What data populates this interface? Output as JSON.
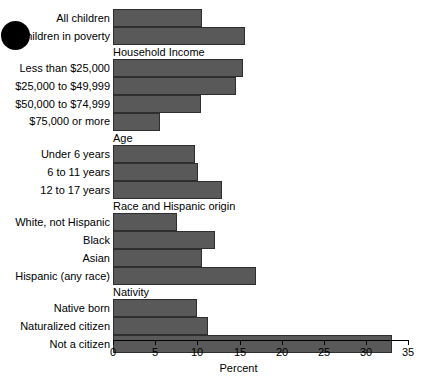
{
  "chart_data": {
    "type": "bar",
    "orientation": "horizontal",
    "title": "",
    "xlabel": "Percent",
    "ylabel": "",
    "xlim": [
      0,
      35
    ],
    "xticks": [
      0,
      5,
      10,
      15,
      20,
      25,
      30,
      35
    ],
    "grid": false,
    "legend": null,
    "bar_color": "#595959",
    "bar_edge_color": "#2e2e2e",
    "groups": [
      {
        "header": "",
        "categories": [
          "All children",
          "Children in poverty"
        ],
        "values": [
          10.6,
          15.7
        ]
      },
      {
        "header": "Household Income",
        "categories": [
          "Less than $25,000",
          "$25,000 to $49,999",
          "$50,000 to $74,999",
          "$75,000 or more"
        ],
        "values": [
          15.4,
          14.6,
          10.4,
          5.6
        ]
      },
      {
        "header": "Age",
        "categories": [
          "Under 6 years",
          "6 to 11 years",
          "12 to 17 years"
        ],
        "values": [
          9.7,
          10.1,
          12.9
        ]
      },
      {
        "header": "Race and Hispanic origin",
        "categories": [
          "White, not Hispanic",
          "Black",
          "Asian",
          "Hispanic (any race)"
        ],
        "values": [
          7.6,
          12.1,
          10.6,
          17.0
        ]
      },
      {
        "header": "Nativity",
        "categories": [
          "Native born",
          "Naturalized citizen",
          "Not a citizen"
        ],
        "values": [
          10.0,
          11.3,
          33.1
        ]
      }
    ],
    "categories": [
      "All children",
      "Children in poverty",
      "Less than $25,000",
      "$25,000 to $49,999",
      "$50,000 to $74,999",
      "$75,000 or more",
      "Under 6 years",
      "6 to 11 years",
      "12 to 17 years",
      "White, not Hispanic",
      "Black",
      "Asian",
      "Hispanic (any race)",
      "Native born",
      "Naturalized citizen",
      "Not a citizen"
    ],
    "values": [
      10.6,
      15.7,
      15.4,
      14.6,
      10.4,
      5.6,
      9.7,
      10.1,
      12.9,
      7.6,
      12.1,
      10.6,
      17.0,
      10.0,
      11.3,
      33.1
    ]
  },
  "axis": {
    "tick_labels": [
      "0",
      "5",
      "10",
      "15",
      "20",
      "25",
      "30",
      "35"
    ],
    "title": "Percent"
  },
  "group_headers": [
    "Household Income",
    "Age",
    "Race and Hispanic origin",
    "Nativity"
  ],
  "marker": {
    "name": "bullet-dot",
    "color": "#000000"
  }
}
